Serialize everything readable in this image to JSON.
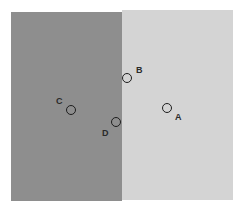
{
  "diagram": {
    "panels": [
      {
        "name": "left-region",
        "color": "#8e8e8e"
      },
      {
        "name": "right-region",
        "color": "#d4d4d4"
      }
    ],
    "points": [
      {
        "label": "A",
        "cx": 167,
        "cy": 108,
        "lx": 175,
        "ly": 113
      },
      {
        "label": "B",
        "cx": 127,
        "cy": 78,
        "lx": 136,
        "ly": 66
      },
      {
        "label": "C",
        "cx": 71,
        "cy": 110,
        "lx": 56,
        "ly": 97
      },
      {
        "label": "D",
        "cx": 116,
        "cy": 122,
        "lx": 102,
        "ly": 129
      }
    ]
  }
}
